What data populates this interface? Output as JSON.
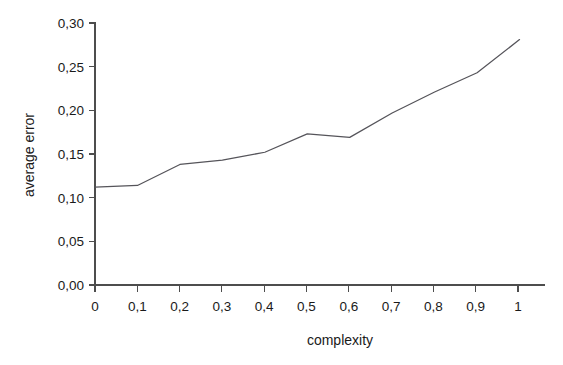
{
  "chart_data": {
    "type": "line",
    "title": "",
    "xlabel": "complexity",
    "ylabel": "average error",
    "xlim": [
      0,
      1.06
    ],
    "ylim": [
      0,
      0.3
    ],
    "grid": false,
    "legend": null,
    "decimal_separator": ",",
    "x": [
      0,
      0.1,
      0.2,
      0.3,
      0.4,
      0.5,
      0.6,
      0.7,
      0.8,
      0.9,
      1
    ],
    "values": [
      0.112,
      0.114,
      0.138,
      0.143,
      0.152,
      0.173,
      0.169,
      0.197,
      0.221,
      0.243,
      0.281
    ],
    "series": [
      {
        "name": "average error",
        "color": "#55545a",
        "values": [
          0.112,
          0.114,
          0.138,
          0.143,
          0.152,
          0.173,
          0.169,
          0.197,
          0.221,
          0.243,
          0.281
        ]
      }
    ],
    "xticks": [
      0,
      0.1,
      0.2,
      0.3,
      0.4,
      0.5,
      0.6,
      0.7,
      0.8,
      0.9,
      1
    ],
    "xticklabels": [
      "0",
      "0,1",
      "0,2",
      "0,3",
      "0,4",
      "0,5",
      "0,6",
      "0,7",
      "0,8",
      "0,9",
      "1"
    ],
    "yticks": [
      0,
      0.05,
      0.1,
      0.15,
      0.2,
      0.25,
      0.3
    ],
    "yticklabels": [
      "0,00",
      "0,05",
      "0,10",
      "0,15",
      "0,20",
      "0,25",
      "0,30"
    ]
  },
  "axes": {
    "y_title": "average error",
    "x_title": "complexity",
    "y_labels": {
      "t0": "0,00",
      "t1": "0,05",
      "t2": "0,10",
      "t3": "0,15",
      "t4": "0,20",
      "t5": "0,25",
      "t6": "0,30"
    },
    "x_labels": {
      "t0": "0",
      "t1": "0,1",
      "t2": "0,2",
      "t3": "0,3",
      "t4": "0,4",
      "t5": "0,5",
      "t6": "0,6",
      "t7": "0,7",
      "t8": "0,8",
      "t9": "0,9",
      "t10": "1"
    }
  },
  "colors": {
    "background": "#ffffff",
    "axis": "#4d4d4d",
    "line": "#55545a",
    "text": "#1a1a1a"
  }
}
